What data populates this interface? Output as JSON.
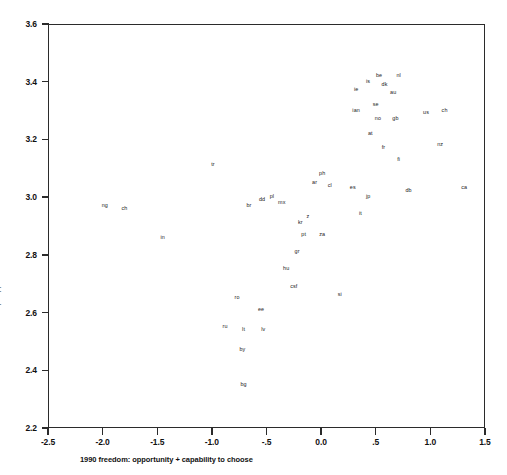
{
  "chart_data": {
    "type": "scatter",
    "title": "",
    "xlabel": "1990 freedom: opportunity + capability to choose",
    "ylabel": "1990 4-step happiness",
    "xlim": [
      -2.5,
      1.5
    ],
    "ylim": [
      2.2,
      3.6
    ],
    "xticks": [
      -2.5,
      -2.0,
      -1.5,
      -1.0,
      -0.5,
      0.0,
      0.5,
      1.0,
      1.5
    ],
    "xticklabels": [
      "-2.5",
      "-2.0",
      "-1.5",
      "-1.0",
      "-.5",
      "0.0",
      ".5",
      "1.0",
      "1.5"
    ],
    "yticks": [
      2.2,
      2.4,
      2.6,
      2.8,
      3.0,
      3.2,
      3.4,
      3.6
    ],
    "yticklabels": [
      "2.2",
      "2.4",
      "2.6",
      "2.8",
      "3.0",
      "3.2",
      "3.4",
      "3.6"
    ],
    "grid": false,
    "legend": false,
    "marker_style": "text-label",
    "point_color": "#1a1a1a",
    "points": [
      {
        "label": "ng",
        "x": -1.98,
        "y": 2.97
      },
      {
        "label": "ch",
        "x": -1.8,
        "y": 2.96
      },
      {
        "label": "in",
        "x": -1.45,
        "y": 2.86
      },
      {
        "label": "tr",
        "x": -0.99,
        "y": 3.11
      },
      {
        "label": "br",
        "x": -0.66,
        "y": 2.97
      },
      {
        "label": "dd",
        "x": -0.54,
        "y": 2.99
      },
      {
        "label": "pl",
        "x": -0.45,
        "y": 3.0
      },
      {
        "label": "mx",
        "x": -0.36,
        "y": 2.98
      },
      {
        "label": "ro",
        "x": -0.77,
        "y": 2.65
      },
      {
        "label": "ee",
        "x": -0.55,
        "y": 2.61
      },
      {
        "label": "ru",
        "x": -0.88,
        "y": 2.55
      },
      {
        "label": "lt",
        "x": -0.71,
        "y": 2.54
      },
      {
        "label": "lv",
        "x": -0.53,
        "y": 2.54
      },
      {
        "label": "by",
        "x": -0.72,
        "y": 2.47
      },
      {
        "label": "bg",
        "x": -0.71,
        "y": 2.35
      },
      {
        "label": "hu",
        "x": -0.32,
        "y": 2.75
      },
      {
        "label": "gr",
        "x": -0.22,
        "y": 2.81
      },
      {
        "label": "csf",
        "x": -0.25,
        "y": 2.69
      },
      {
        "label": "pt",
        "x": -0.16,
        "y": 2.87
      },
      {
        "label": "za",
        "x": 0.01,
        "y": 2.87
      },
      {
        "label": "kr",
        "x": -0.19,
        "y": 2.91
      },
      {
        "label": "z",
        "x": -0.12,
        "y": 2.93
      },
      {
        "label": "ar",
        "x": -0.06,
        "y": 3.05
      },
      {
        "label": "ph",
        "x": 0.01,
        "y": 3.08
      },
      {
        "label": "cl",
        "x": 0.08,
        "y": 3.04
      },
      {
        "label": "si",
        "x": 0.17,
        "y": 2.66
      },
      {
        "label": "es",
        "x": 0.29,
        "y": 3.03
      },
      {
        "label": "jp",
        "x": 0.43,
        "y": 3.0
      },
      {
        "label": "it",
        "x": 0.36,
        "y": 2.94
      },
      {
        "label": "ie",
        "x": 0.32,
        "y": 3.37
      },
      {
        "label": "is",
        "x": 0.43,
        "y": 3.4
      },
      {
        "label": "be",
        "x": 0.53,
        "y": 3.42
      },
      {
        "label": "nl",
        "x": 0.71,
        "y": 3.42
      },
      {
        "label": "dk",
        "x": 0.58,
        "y": 3.39
      },
      {
        "label": "au",
        "x": 0.66,
        "y": 3.36
      },
      {
        "label": "ian",
        "x": 0.32,
        "y": 3.3
      },
      {
        "label": "se",
        "x": 0.5,
        "y": 3.32
      },
      {
        "label": "gb",
        "x": 0.68,
        "y": 3.27
      },
      {
        "label": "no",
        "x": 0.52,
        "y": 3.27
      },
      {
        "label": "at",
        "x": 0.45,
        "y": 3.22
      },
      {
        "label": "fr",
        "x": 0.57,
        "y": 3.17
      },
      {
        "label": "fi",
        "x": 0.71,
        "y": 3.13
      },
      {
        "label": "db",
        "x": 0.8,
        "y": 3.02
      },
      {
        "label": "us",
        "x": 0.96,
        "y": 3.29
      },
      {
        "label": "ch",
        "x": 1.13,
        "y": 3.3
      },
      {
        "label": "nz",
        "x": 1.09,
        "y": 3.18
      },
      {
        "label": "ca",
        "x": 1.31,
        "y": 3.03
      }
    ]
  }
}
